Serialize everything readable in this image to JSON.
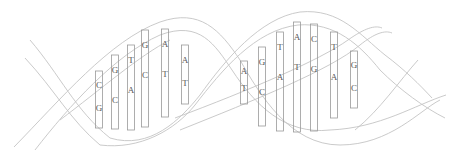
{
  "diagram": {
    "colors": {
      "strand": "#c4c4c4",
      "bar": "#9a9a9a",
      "text": "#555555",
      "background": "#ffffff"
    },
    "base_pairs": [
      {
        "top": "C",
        "bottom": "G",
        "x": 99,
        "y1": 71,
        "y2": 128
      },
      {
        "top": "G",
        "bottom": "C",
        "x": 115,
        "y1": 55,
        "y2": 129
      },
      {
        "top": "T",
        "bottom": "A",
        "x": 131,
        "y1": 45,
        "y2": 130
      },
      {
        "top": "G",
        "bottom": "C",
        "x": 145,
        "y1": 30,
        "y2": 127
      },
      {
        "top": "A",
        "bottom": "T",
        "x": 165,
        "y1": 29,
        "y2": 117
      },
      {
        "top": "A",
        "bottom": "T",
        "x": 185,
        "y1": 45,
        "y2": 104
      },
      {
        "top": "A",
        "bottom": "T",
        "x": 244,
        "y1": 61,
        "y2": 104
      },
      {
        "top": "G",
        "bottom": "C",
        "x": 262,
        "y1": 47,
        "y2": 126
      },
      {
        "top": "T",
        "bottom": "A",
        "x": 280,
        "y1": 32,
        "y2": 131
      },
      {
        "top": "A",
        "bottom": "T",
        "x": 297,
        "y1": 22,
        "y2": 132
      },
      {
        "top": "C",
        "bottom": "G",
        "x": 314,
        "y1": 24,
        "y2": 131
      },
      {
        "top": "T",
        "bottom": "A",
        "x": 334,
        "y1": 32,
        "y2": 118
      },
      {
        "top": "G",
        "bottom": "C",
        "x": 354,
        "y1": 51,
        "y2": 108
      }
    ]
  }
}
